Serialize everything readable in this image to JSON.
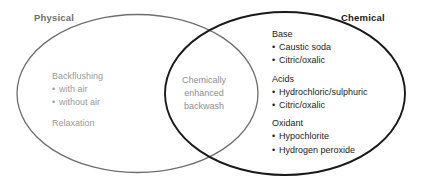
{
  "diagram": {
    "type": "venn",
    "sets": {
      "left": {
        "label": "Physical",
        "stroke_color": "#6e6e6e",
        "text_color": "#9a9a9a"
      },
      "right": {
        "label": "Chemical",
        "stroke_color": "#1a1a1a",
        "text_color": "#1c1c1c"
      }
    },
    "left_only": {
      "groups": [
        {
          "heading": "Backflushing",
          "items": [
            "with air",
            "without air"
          ]
        },
        {
          "heading": "Relaxation",
          "items": []
        }
      ]
    },
    "intersection": {
      "lines": [
        "Chemically",
        "enhanced",
        "backwash"
      ],
      "text_color": "#8f8f8f"
    },
    "right_only": {
      "groups": [
        {
          "heading": "Base",
          "items": [
            "Caustic soda",
            "Citric/oxalic"
          ]
        },
        {
          "heading": "Acids",
          "items": [
            "Hydrochloric/sulphuric",
            "Citric/oxalic"
          ]
        },
        {
          "heading": "Oxidant",
          "items": [
            "Hypochlorite",
            "Hydrogen peroxide"
          ]
        }
      ]
    },
    "bullet_glyph": "•",
    "background_color": "#ffffff"
  }
}
